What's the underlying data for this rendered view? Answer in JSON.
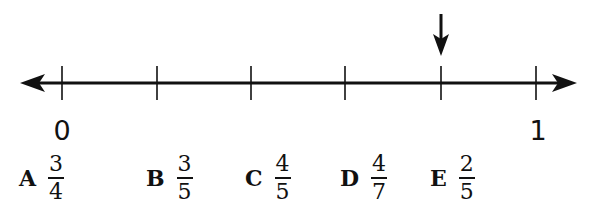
{
  "number_line": {
    "start_label": "0",
    "end_label": "1",
    "tick_count": 6,
    "tick_x": [
      62,
      157,
      251,
      345,
      441,
      536
    ],
    "axis_y": 83,
    "left_arrow_tip_x": 20,
    "right_arrow_tip_x": 576,
    "marker": {
      "icon": "down-arrow-icon",
      "tick_index": 4,
      "x": 441
    },
    "line_color": "#111111"
  },
  "choices": [
    {
      "letter": "A",
      "numerator": "3",
      "denominator": "4"
    },
    {
      "letter": "B",
      "numerator": "3",
      "denominator": "5"
    },
    {
      "letter": "C",
      "numerator": "4",
      "denominator": "5"
    },
    {
      "letter": "D",
      "numerator": "4",
      "denominator": "7"
    },
    {
      "letter": "E",
      "numerator": "2",
      "denominator": "5"
    }
  ]
}
